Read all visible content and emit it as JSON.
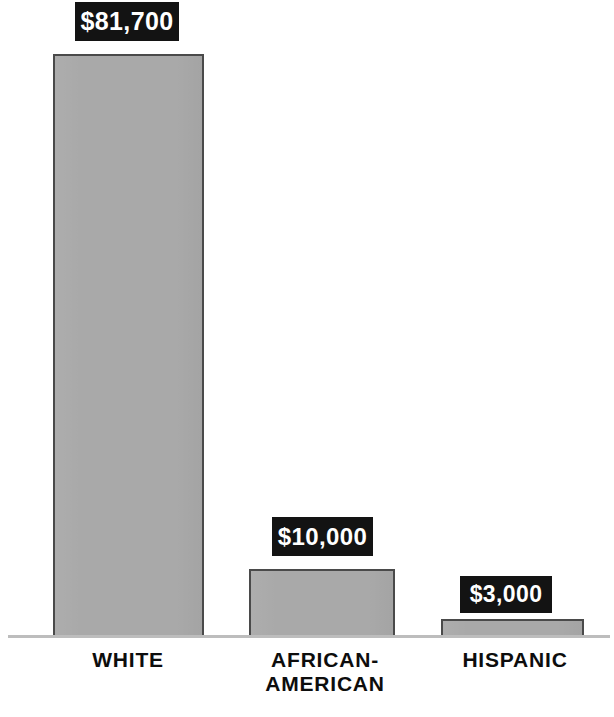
{
  "chart_data": {
    "type": "bar",
    "title": "",
    "subtitle": "",
    "xlabel": "",
    "ylabel": "",
    "categories": [
      "WHITE",
      "AFRICAN-AMERICAN",
      "HISPANIC"
    ],
    "values": [
      81700,
      10000,
      3000
    ],
    "value_labels": [
      "$81,700",
      "$10,000",
      "$3,000"
    ],
    "ylim": [
      0,
      81700
    ],
    "grid": false,
    "legend": null,
    "annotations": [
      {
        "category": "WHITE",
        "label": "$81,700",
        "style": "black-box-white-text"
      },
      {
        "category": "AFRICAN-AMERICAN",
        "label": "$10,000",
        "style": "black-box-white-text"
      },
      {
        "category": "HISPANIC",
        "label": "$3,000",
        "style": "black-box-white-text"
      }
    ],
    "colors": {
      "bar_fill": "#a9a9a9",
      "bar_border": "#4a4a4a",
      "label_box_background": "#131313",
      "label_box_text": "#ffffff",
      "axis_line": "#bdbdbd",
      "category_text": "#0d0d0d",
      "background": "#ffffff"
    }
  },
  "bars": [
    {
      "id": "white",
      "category_label": "WHITE",
      "category_line1": "WHITE",
      "category_line2": "",
      "value_label": "$81,700"
    },
    {
      "id": "african-american",
      "category_label": "AFRICAN-AMERICAN",
      "category_line1": "AFRICAN-",
      "category_line2": "AMERICAN",
      "value_label": "$10,000"
    },
    {
      "id": "hispanic",
      "category_label": "HISPANIC",
      "category_line1": "HISPANIC",
      "category_line2": "",
      "value_label": "$3,000"
    }
  ],
  "footnote": {
    "text": "",
    "visible": false
  }
}
